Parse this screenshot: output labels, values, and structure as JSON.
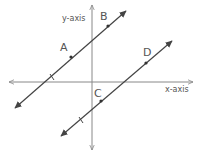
{
  "diagram": {
    "colors": {
      "axis": "#888888",
      "line": "#444444",
      "point": "#333333",
      "text": "#555555"
    },
    "axes": {
      "x_label": "x-axis",
      "y_label": "y-axis"
    },
    "lines": [
      {
        "name": "line-AB",
        "points": [
          "A",
          "B"
        ]
      },
      {
        "name": "line-CD",
        "points": [
          "C",
          "D"
        ]
      }
    ],
    "points": {
      "A": "A",
      "B": "B",
      "C": "C",
      "D": "D"
    }
  }
}
